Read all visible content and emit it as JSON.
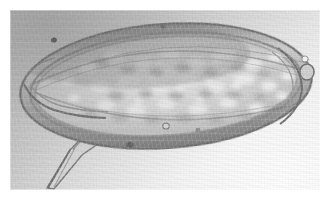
{
  "figure": {
    "kind": "photomicrograph",
    "modality": "light-microscopy",
    "color_mode": "grayscale",
    "alt_text": "Grayscale light photomicrograph of an elongated oval parasite egg with a thick double-layered shell, granular internal contents, and a prominent pointed lateral spine projecting from the lower-left end.",
    "canvas": {
      "width": 331,
      "height": 204
    },
    "paper_margin_px": 10,
    "plate": {
      "x": 10,
      "y": 10,
      "width": 310,
      "height": 180
    }
  },
  "colors": {
    "paper_white": "#ffffff",
    "field_light": "#ececec",
    "field_mid": "#d2d2d2",
    "field_dark": "#bcbcbc",
    "shell_outline": "#7b7b7b",
    "shell_dark": "#6a6a6a",
    "shell_wall": "#a9a9a9",
    "interior_light": "#e4e4e4",
    "interior_mid": "#c6c6c6",
    "granule_highlight": "#f2f2f2",
    "nodule_dark": "#5d5d5d"
  },
  "specimen": {
    "label": "parasite-egg",
    "body": {
      "shape": "ellipse",
      "center_x": 166,
      "center_y": 86,
      "radius_x": 148,
      "radius_y": 65,
      "rotation_deg": -4
    },
    "shell": {
      "layers": 2,
      "outer_thickness_px": 4,
      "inner_thickness_px": 3,
      "description": "double-contoured refractile shell wall"
    },
    "interior": {
      "texture": "granular mottled miracidium contents",
      "blob_count": 64
    },
    "spine": {
      "present": true,
      "position": "lateral, lower-left",
      "base_x": 52,
      "base_y": 131,
      "tip_x": 47,
      "tip_y": 187,
      "description": "prominent pointed lateral spine"
    },
    "operculum_knob": {
      "present": true,
      "x": 303,
      "y": 60,
      "description": "bright refractile knob at right pole"
    },
    "surface_nodules": [
      {
        "x": 54,
        "y": 40,
        "r": 3.0
      },
      {
        "x": 163,
        "y": 27,
        "r": 2.6
      },
      {
        "x": 130,
        "y": 145,
        "r": 3.4
      },
      {
        "x": 303,
        "y": 57,
        "r": 3.0
      },
      {
        "x": 166,
        "y": 126,
        "r": 3.2
      }
    ]
  }
}
